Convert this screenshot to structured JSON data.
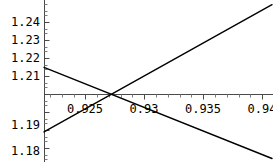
{
  "chart_data": {
    "type": "line",
    "title": "",
    "subtitle": "",
    "xlabel": "",
    "ylabel": "",
    "grid": false,
    "legend": null,
    "axis_style": "mathematica-crossing-axes",
    "xlim": [
      0.9215,
      0.9408
    ],
    "ylim": [
      1.1785,
      1.2475
    ],
    "x_ticks": [
      {
        "value": 0.925,
        "label": "0.925"
      },
      {
        "value": 0.93,
        "label": "0.93"
      },
      {
        "value": 0.935,
        "label": "0.935"
      },
      {
        "value": 0.94,
        "label": "0.94"
      }
    ],
    "x_minor_tick_step": 0.001,
    "y_ticks": [
      {
        "value": 1.24,
        "label": "1.24"
      },
      {
        "value": 1.23,
        "label": "1.23"
      },
      {
        "value": 1.22,
        "label": "1.22"
      },
      {
        "value": 1.21,
        "label": "1.21"
      },
      {
        "value": 1.19,
        "label": "1.19"
      },
      {
        "value": 1.18,
        "label": "1.18"
      }
    ],
    "y_minor_tick_step": 0.002,
    "x_axis_position_y": 1.2,
    "y_axis_position_x": 0.9215,
    "series": [
      {
        "name": "ascending-line",
        "color": "#000000",
        "x": [
          0.9215,
          0.9408
        ],
        "values": [
          1.1913,
          1.2455
        ]
      },
      {
        "name": "descending-line",
        "color": "#000000",
        "x": [
          0.9215,
          0.9408
        ],
        "values": [
          1.2188,
          1.18
        ]
      }
    ],
    "intersection": {
      "x": 0.9264,
      "y": 1.2032
    }
  },
  "axis_labels": {
    "y": {
      "t0": "1.24",
      "t1": "1.23",
      "t2": "1.22",
      "t3": "1.21",
      "t4": "1.19",
      "t5": "1.18"
    },
    "x": {
      "t0": "0.925",
      "t1": "0.93",
      "t2": "0.935",
      "t3": "0.94"
    }
  },
  "colors": {
    "background": "#ffffff",
    "axis": "#4a4a4a",
    "curve": "#111111",
    "text": "#000000"
  }
}
